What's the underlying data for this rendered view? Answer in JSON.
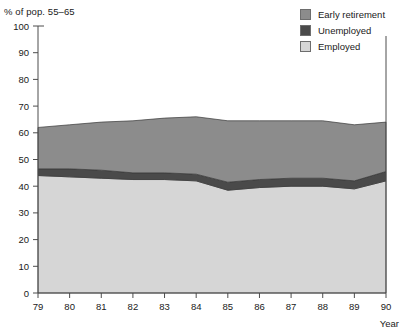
{
  "chart_data": {
    "type": "area",
    "title": "",
    "subtitle": "",
    "ylabel": "% of pop. 55–65",
    "xlabel": "Year",
    "grid": false,
    "legend_position": "top-right",
    "categories": [
      "79",
      "80",
      "81",
      "82",
      "83",
      "84",
      "85",
      "86",
      "87",
      "88",
      "89",
      "90"
    ],
    "x": [
      79,
      80,
      81,
      82,
      83,
      84,
      85,
      86,
      87,
      88,
      89,
      90
    ],
    "ylim": [
      0,
      100
    ],
    "yticks": [
      0,
      10,
      20,
      30,
      40,
      50,
      60,
      70,
      80,
      90,
      100
    ],
    "xticks": [
      "79",
      "80",
      "81",
      "82",
      "83",
      "84",
      "85",
      "86",
      "87",
      "88",
      "89",
      "90"
    ],
    "stacked": true,
    "series": [
      {
        "name": "Employed",
        "color": "#d6d6d6",
        "values": [
          44.0,
          43.5,
          43.0,
          42.5,
          42.5,
          42.0,
          38.5,
          39.5,
          40.0,
          40.0,
          39.0,
          42.0
        ]
      },
      {
        "name": "Unemployed",
        "color": "#4a4a4a",
        "values": [
          2.5,
          3.0,
          3.0,
          2.5,
          2.5,
          2.5,
          3.0,
          3.0,
          3.0,
          3.0,
          3.0,
          3.5
        ]
      },
      {
        "name": "Early retirement",
        "color": "#8c8c8c",
        "values": [
          15.5,
          16.5,
          18.0,
          19.5,
          20.5,
          21.5,
          23.0,
          22.0,
          21.5,
          21.5,
          21.0,
          18.5
        ]
      }
    ],
    "cumulative_totals": [
      62.0,
      63.0,
      64.0,
      64.5,
      65.5,
      66.0,
      64.5,
      64.5,
      64.5,
      64.5,
      63.0,
      64.0
    ],
    "annotations": []
  },
  "legend": {
    "items": [
      {
        "label": "Early retirement",
        "color": "#8c8c8c"
      },
      {
        "label": "Unemployed",
        "color": "#4a4a4a"
      },
      {
        "label": "Employed",
        "color": "#d6d6d6"
      }
    ]
  },
  "axes": {
    "y_axis_caption": "% of pop. 55–65",
    "x_axis_caption": "Year",
    "y_tick_labels": [
      "100",
      "90",
      "80",
      "70",
      "60",
      "50",
      "40",
      "30",
      "20",
      "10",
      "0"
    ],
    "x_tick_labels": [
      "79",
      "80",
      "81",
      "82",
      "83",
      "84",
      "85",
      "86",
      "87",
      "88",
      "89",
      "90"
    ]
  },
  "colors": {
    "early_retirement": "#8c8c8c",
    "unemployed": "#4a4a4a",
    "employed": "#d6d6d6",
    "axis": "#4d4d4d",
    "text": "#1a1a1a",
    "background": "#ffffff"
  }
}
